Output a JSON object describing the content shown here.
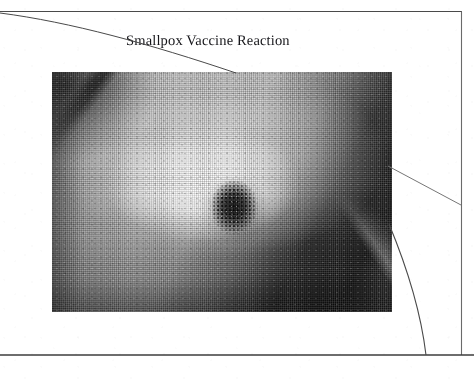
{
  "page": {
    "kind": "scanned-figure-page",
    "background_color": "#ffffff",
    "width": 474,
    "height": 386
  },
  "caption": {
    "text": "Smallpox Vaccine Reaction"
  },
  "figure": {
    "alt": "Black and white halftone clinical photograph of a smallpox vaccination site reaction on skin",
    "tone": "grayscale-halftone",
    "frame": {
      "x": 52,
      "y": 72,
      "width": 340,
      "height": 240
    }
  },
  "rules": {
    "border_color": "#3a3a3a",
    "top_rule": {
      "x1": 0,
      "y1": 11,
      "x2": 462,
      "y2": 11
    },
    "right_rule": {
      "x1": 461,
      "y1": 11,
      "x2": 461,
      "y2": 355
    },
    "bottom_rule": {
      "x1": 0,
      "y1": 355,
      "x2": 474,
      "y2": 355
    },
    "top_left_arc": "sweeping arc from top-left edge through the caption to the top edge of the photograph",
    "right_diagonal": "straight line from the photograph's right edge up to the right rule",
    "lower_right_arc": "arc from the photograph's lower right curving down to the bottom rule"
  }
}
